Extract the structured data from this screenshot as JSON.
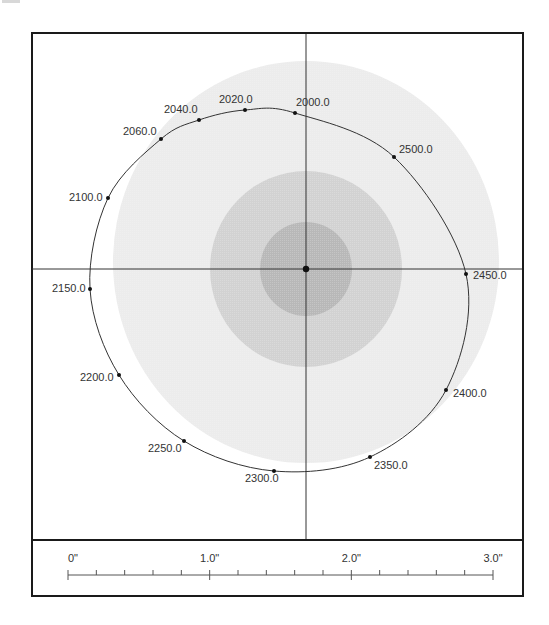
{
  "chart_data": {
    "type": "scatter",
    "subtype": "traveling-cylinder-plot",
    "title": "",
    "xlabel": "",
    "ylabel": "",
    "grid": false,
    "legend": null,
    "crosshair": {
      "center_px": [
        306,
        269
      ]
    },
    "target_zones": [
      {
        "name": "outer-zone",
        "cx": 306,
        "cy": 262,
        "rx": 193,
        "ry": 201,
        "color": "#ececec"
      },
      {
        "name": "middle-zone",
        "cx": 306,
        "cy": 269,
        "rx": 96,
        "ry": 98,
        "color": "#d2d2d2"
      },
      {
        "name": "inner-zone",
        "cx": 306,
        "cy": 269,
        "rx": 46,
        "ry": 47,
        "color": "#b8b8b8"
      }
    ],
    "series": [
      {
        "name": "offset-well-trajectory",
        "closed": true,
        "points": [
          {
            "label": "2000.0",
            "x": 295,
            "y": 113,
            "lx": 296,
            "ly": 106,
            "anchor": "start"
          },
          {
            "label": "2020.0",
            "x": 245,
            "y": 110,
            "lx": 219,
            "ly": 103,
            "anchor": "start"
          },
          {
            "label": "2040.0",
            "x": 199,
            "y": 120,
            "lx": 164,
            "ly": 113,
            "anchor": "start"
          },
          {
            "label": "2060.0",
            "x": 161,
            "y": 139,
            "lx": 123,
            "ly": 135,
            "anchor": "start"
          },
          {
            "label": "2100.0",
            "x": 108,
            "y": 198,
            "lx": 69,
            "ly": 201,
            "anchor": "start"
          },
          {
            "label": "2150.0",
            "x": 90,
            "y": 289,
            "lx": 52,
            "ly": 292,
            "anchor": "start"
          },
          {
            "label": "2200.0",
            "x": 119,
            "y": 375,
            "lx": 80,
            "ly": 381,
            "anchor": "start"
          },
          {
            "label": "2250.0",
            "x": 184,
            "y": 441,
            "lx": 148,
            "ly": 452,
            "anchor": "start"
          },
          {
            "label": "2300.0",
            "x": 274,
            "y": 471,
            "lx": 245,
            "ly": 482,
            "anchor": "start"
          },
          {
            "label": "2350.0",
            "x": 370,
            "y": 457,
            "lx": 374,
            "ly": 469,
            "anchor": "start"
          },
          {
            "label": "2400.0",
            "x": 446,
            "y": 390,
            "lx": 453,
            "ly": 397,
            "anchor": "start"
          },
          {
            "label": "2450.0",
            "x": 466,
            "y": 274,
            "lx": 473,
            "ly": 279,
            "anchor": "start"
          },
          {
            "label": "2500.0",
            "x": 394,
            "y": 157,
            "lx": 399,
            "ly": 153,
            "anchor": "start"
          }
        ]
      }
    ],
    "scale_bar": {
      "unit": "inch",
      "labels": [
        "0\"",
        "1.0\"",
        "2.0\"",
        "3.0\""
      ],
      "major_ticks": [
        0,
        1.0,
        2.0,
        3.0
      ],
      "minor_divisions_per_unit": 5,
      "range": [
        0,
        3.0
      ],
      "x_start_px": 68,
      "x_end_px": 493,
      "y_px": 575
    },
    "frame": {
      "plot_box": [
        31,
        33,
        523,
        540
      ],
      "scale_box": [
        31,
        540,
        523,
        596
      ]
    }
  }
}
